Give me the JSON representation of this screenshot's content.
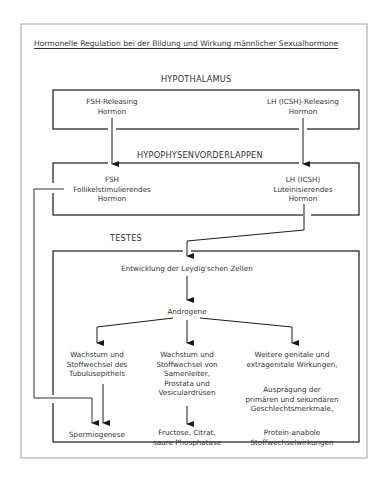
{
  "title": "Hormonelle Regulation bei der Bildung und Wirkung männlicher Sexualhormone",
  "hypothalamus": {
    "label": "HYPOTHALAMUS",
    "fsh_releasing": [
      "FSH-Releasing",
      "Hormon"
    ],
    "lh_releasing": [
      "LH (ICSH)-Releasing",
      "Hormon"
    ]
  },
  "hypophyse": {
    "label": "HYPOPHYSENVORDERLAPPEN",
    "fsh": [
      "FSH",
      "Follikelstimulierendes",
      "Hormon"
    ],
    "lh": [
      "LH (ICSH)",
      "Luteinisierendes",
      "Hormon"
    ]
  },
  "testes": {
    "label": "TESTES",
    "leydig": "Entwicklung der Leydig'schen Zellen",
    "androgene": "Androgene",
    "col1": [
      "Wachstum und",
      "Stoffwechsel des",
      "Tubulusepithels"
    ],
    "col1_result": "Spermiogenese",
    "col2": [
      "Wachstum und",
      "Stoffwechsel von",
      "Samenleiter,",
      "Prostata und",
      "Vesiculardrüsen"
    ],
    "col2_result": [
      "Fructose, Citrat,",
      "saure Phosphatase"
    ],
    "col3a": [
      "Weitere genitale und",
      "extragenitale Wirkungen,"
    ],
    "col3b": [
      "Ausprägung der",
      "primären und sekundären",
      "Geschlechtsmerkmale,"
    ],
    "col3c": [
      "Protein-anabole",
      "Stoffwechselwirkungen"
    ]
  },
  "colors": {
    "line": "#1a1a1a",
    "frame": "#777777",
    "text": "#333333"
  }
}
